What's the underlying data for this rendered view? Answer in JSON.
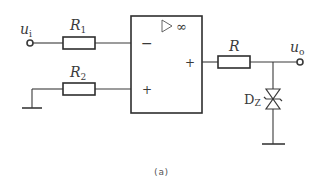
{
  "diagram": {
    "type": "circuit",
    "caption": "(a)",
    "input": {
      "label_main": "u",
      "label_sub": "i"
    },
    "output": {
      "label_main": "u",
      "label_sub": "o"
    },
    "resistors": [
      {
        "id": "R1",
        "label_main": "R",
        "label_sub": "1"
      },
      {
        "id": "R2",
        "label_main": "R",
        "label_sub": "2"
      },
      {
        "id": "R",
        "label_main": "R",
        "label_sub": ""
      }
    ],
    "opamp": {
      "symbol": "▷∞",
      "inverting_sign": "−",
      "noninverting_sign": "+",
      "output_sign": "+"
    },
    "zener": {
      "label_main": "D",
      "label_sub": "Z"
    },
    "colors": {
      "line": "#3a3a3a",
      "background": "#ffffff"
    }
  }
}
